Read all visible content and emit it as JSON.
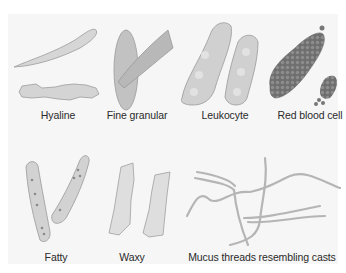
{
  "figure": {
    "colors": {
      "background": "#f6f6f6",
      "cast_fill": "#d2d2d2",
      "cast_edge": "#9a9a9a",
      "rbc_fill": "#7a7a7a",
      "thread": "#b8b8b8"
    },
    "items": [
      {
        "id": "hyaline",
        "label": "Hyaline"
      },
      {
        "id": "fine-granular",
        "label": "Fine granular"
      },
      {
        "id": "leukocyte",
        "label": "Leukocyte"
      },
      {
        "id": "red-blood-cell",
        "label": "Red blood cell"
      },
      {
        "id": "fatty",
        "label": "Fatty"
      },
      {
        "id": "waxy",
        "label": "Waxy"
      },
      {
        "id": "mucus-threads",
        "label": "Mucus threads resembling casts"
      }
    ]
  }
}
